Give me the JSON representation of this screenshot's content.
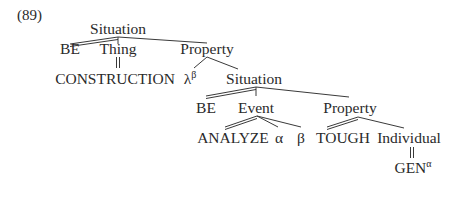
{
  "example_number": "(89)",
  "tree": {
    "root": {
      "label": "Situation"
    },
    "be1": {
      "label": "BE"
    },
    "thing": {
      "label": "Thing"
    },
    "property1": {
      "label": "Property"
    },
    "construction": {
      "label": "CONSTRUCTION"
    },
    "lambda": {
      "label": "λ",
      "sup": "β"
    },
    "situation2": {
      "label": "Situation"
    },
    "be2": {
      "label": "BE"
    },
    "event": {
      "label": "Event"
    },
    "property2": {
      "label": "Property"
    },
    "analyze": {
      "label": "ANALYZE"
    },
    "alpha": {
      "label": "α"
    },
    "beta": {
      "label": "β"
    },
    "tough": {
      "label": "TOUGH"
    },
    "individual": {
      "label": "Individual"
    },
    "gen": {
      "label": "GEN",
      "sup": "α"
    }
  },
  "colors": {
    "line": "#3a3a3a",
    "text": "#2a2a2a"
  }
}
